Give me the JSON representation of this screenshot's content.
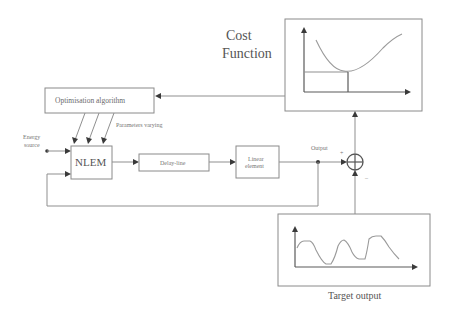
{
  "diagram": {
    "cost_function": {
      "title_line1": "Cost",
      "title_line2": "Function"
    },
    "blocks": {
      "optimization": "Optimisation algorithm",
      "nlem": "NLEM",
      "delay": "Delay-line",
      "linear_line1": "Linear",
      "linear_line2": "element"
    },
    "labels": {
      "parameters": "Parameters varying",
      "energy_line1": "Energy",
      "energy_line2": "source",
      "output": "Output",
      "plus": "+",
      "minus": "–",
      "target_output": "Target output"
    },
    "colors": {
      "line": "#8f8f8f",
      "arrow": "#3a3a3a",
      "text": "#555555"
    }
  }
}
